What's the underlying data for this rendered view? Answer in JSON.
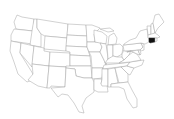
{
  "map": {
    "title": "United States",
    "highlighted_state": "Connecticut",
    "highlight_color": "#111111",
    "base_fill": "#ffffff",
    "border_color": "#9a9a9a"
  }
}
